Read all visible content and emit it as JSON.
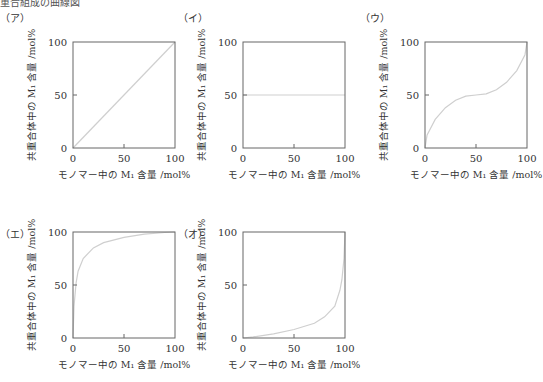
{
  "header": {
    "partial_title": "重合組成の曲線図"
  },
  "chart_data": [
    {
      "id": "a",
      "label": "（ア）",
      "type": "line",
      "xlabel": "モノマー中の M₁ 含量 /mol%",
      "ylabel": "共重合体中の M₁ 含量 /mol%",
      "xticks": [
        "0",
        "50",
        "100"
      ],
      "yticks": [
        "0",
        "50",
        "100"
      ],
      "xlim": [
        0,
        100
      ],
      "ylim": [
        0,
        100
      ],
      "grid": false,
      "x": [
        0,
        25,
        50,
        75,
        100
      ],
      "y": [
        0,
        25,
        50,
        75,
        100
      ],
      "description": "ideal/azeotropic diagonal y = x"
    },
    {
      "id": "i",
      "label": "（イ）",
      "type": "line",
      "xlabel": "モノマー中の M₁ 含量 /mol%",
      "ylabel": "共重合体中の M₁ 含量 /mol%",
      "xticks": [
        "0",
        "50",
        "100"
      ],
      "yticks": [
        "0",
        "50",
        "100"
      ],
      "xlim": [
        0,
        100
      ],
      "ylim": [
        0,
        100
      ],
      "grid": false,
      "x": [
        0,
        25,
        50,
        75,
        100
      ],
      "y": [
        50,
        50,
        50,
        50,
        50
      ],
      "description": "alternating copolymer, constant y = 50"
    },
    {
      "id": "u",
      "label": "（ウ）",
      "type": "line",
      "xlabel": "モノマー中の M₁ 含量 /mol%",
      "ylabel": "共重合体中の M₁ 含量 /mol%",
      "xticks": [
        "0",
        "50",
        "100"
      ],
      "yticks": [
        "0",
        "50",
        "100"
      ],
      "xlim": [
        0,
        100
      ],
      "ylim": [
        0,
        100
      ],
      "grid": false,
      "x": [
        0,
        2,
        10,
        20,
        30,
        40,
        50,
        60,
        70,
        80,
        90,
        98,
        100
      ],
      "y": [
        0,
        12,
        27,
        38,
        45,
        49,
        50,
        51,
        55,
        62,
        73,
        88,
        100
      ],
      "description": "S-shaped curve with azeotrope near 50"
    },
    {
      "id": "e",
      "label": "（エ）",
      "type": "line",
      "xlabel": "モノマー中の M₁ 含量 /mol%",
      "ylabel": "共重合体中の M₁ 含量 /mol%",
      "xticks": [
        "0",
        "50",
        "100"
      ],
      "yticks": [
        "0",
        "50",
        "100"
      ],
      "xlim": [
        0,
        100
      ],
      "ylim": [
        0,
        100
      ],
      "grid": false,
      "x": [
        0,
        1,
        3,
        5,
        10,
        20,
        30,
        50,
        70,
        90,
        100
      ],
      "y": [
        0,
        30,
        52,
        63,
        75,
        85,
        90,
        95,
        98,
        99.5,
        100
      ],
      "description": "convex curve, M1 strongly preferred"
    },
    {
      "id": "o",
      "label": "（オ）",
      "type": "line",
      "xlabel": "モノマー中の M₁ 含量 /mol%",
      "ylabel": "共重合体中の M₁ 含量 /mol%",
      "xticks": [
        "0",
        "50",
        "100"
      ],
      "yticks": [
        "0",
        "50",
        "100"
      ],
      "xlim": [
        0,
        100
      ],
      "ylim": [
        0,
        100
      ],
      "grid": false,
      "x": [
        0,
        10,
        30,
        50,
        70,
        80,
        90,
        95,
        97,
        99,
        100
      ],
      "y": [
        0,
        1,
        4,
        8,
        14,
        20,
        30,
        45,
        55,
        75,
        100
      ],
      "description": "concave curve, M2 strongly preferred"
    }
  ]
}
